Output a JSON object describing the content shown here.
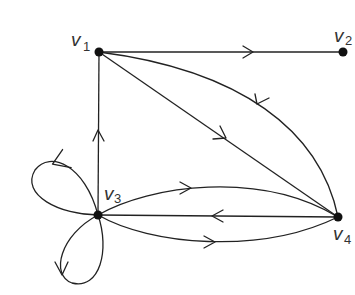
{
  "graph": {
    "type": "directed multigraph",
    "vertices": [
      {
        "id": "v1",
        "label": "v",
        "sub": "1",
        "x": 99,
        "y": 52
      },
      {
        "id": "v2",
        "label": "v",
        "sub": "2",
        "x": 343,
        "y": 52
      },
      {
        "id": "v3",
        "label": "v",
        "sub": "3",
        "x": 98,
        "y": 215
      },
      {
        "id": "v4",
        "label": "v",
        "sub": "4",
        "x": 338,
        "y": 217
      }
    ],
    "edges": [
      {
        "from": "v1",
        "to": "v2",
        "shape": "straight"
      },
      {
        "from": "v1",
        "to": "v4",
        "shape": "straight"
      },
      {
        "from": "v4",
        "to": "v1",
        "shape": "curved"
      },
      {
        "from": "v3",
        "to": "v1",
        "shape": "straight"
      },
      {
        "from": "v3",
        "to": "v4",
        "shape": "curved-upper"
      },
      {
        "from": "v4",
        "to": "v3",
        "shape": "straight"
      },
      {
        "from": "v3",
        "to": "v4",
        "shape": "curved-lower"
      },
      {
        "from": "v3",
        "to": "v3",
        "shape": "loop-upper-left"
      },
      {
        "from": "v3",
        "to": "v3",
        "shape": "loop-lower"
      }
    ]
  }
}
